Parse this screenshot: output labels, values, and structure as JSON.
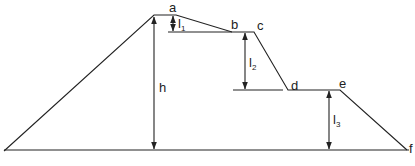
{
  "diagram": {
    "type": "embankment-profile",
    "points": {
      "a": {
        "label": "a",
        "x": 165,
        "y": 15
      },
      "b": {
        "label": "b",
        "x": 232,
        "y": 32
      },
      "c": {
        "label": "c",
        "x": 254,
        "y": 32
      },
      "d": {
        "label": "d",
        "x": 288,
        "y": 90
      },
      "e": {
        "label": "e",
        "x": 340,
        "y": 90
      },
      "f": {
        "label": "f",
        "x": 407,
        "y": 150
      }
    },
    "dimensions": {
      "h": {
        "label": "h"
      },
      "l1": {
        "label": "l",
        "sub": "1"
      },
      "l2": {
        "label": "l",
        "sub": "2"
      },
      "l3": {
        "label": "l",
        "sub": "3"
      }
    },
    "colors": {
      "stroke": "#222222",
      "background": "#ffffff"
    }
  }
}
